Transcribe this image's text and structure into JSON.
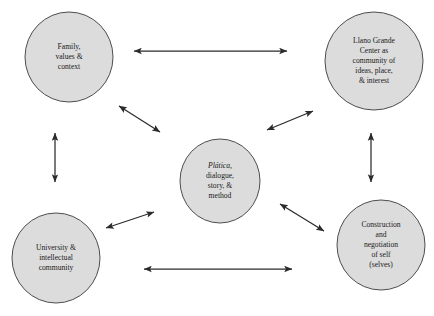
{
  "diagram": {
    "background_color": "#ffffff",
    "node_fill_color": "#dcdcdc",
    "node_stroke_color": "#4d4d4d",
    "connector_color": "#2b2b2b",
    "nodes": [
      {
        "id": "family",
        "name": "family-values-context",
        "cx": 69,
        "cy": 57,
        "rx": 44,
        "ry": 45,
        "lines": [
          "Family,",
          "values &",
          "context"
        ],
        "italic_first_line": false
      },
      {
        "id": "llano",
        "name": "llano-grande-center",
        "cx": 374,
        "cy": 61,
        "rx": 49,
        "ry": 49,
        "lines": [
          "Llano Grande",
          "Center as",
          "community of",
          "ideas, place,",
          "& interest"
        ],
        "italic_first_line": false
      },
      {
        "id": "platica",
        "name": "platica-dialogue-story-method",
        "cx": 220,
        "cy": 181,
        "rx": 40,
        "ry": 42,
        "lines": [
          "Plática,",
          "dialogue,",
          "story, &",
          "method"
        ],
        "italic_first_line": true
      },
      {
        "id": "university",
        "name": "university-intellectual-community",
        "cx": 56,
        "cy": 258,
        "rx": 44,
        "ry": 45,
        "lines": [
          "University &",
          "intellectual",
          "community"
        ],
        "italic_first_line": false
      },
      {
        "id": "construction",
        "name": "construction-negotiation-of-self",
        "cx": 381,
        "cy": 245,
        "rx": 44,
        "ry": 45,
        "lines": [
          "Construction",
          "and",
          "negotiation",
          "of self",
          "(selves)"
        ],
        "italic_first_line": false
      }
    ],
    "connectors": [
      {
        "id": "family-llano",
        "name": "connector-family-to-llano",
        "x1": 134,
        "y1": 51,
        "x2": 287,
        "y2": 51,
        "double_headed": true
      },
      {
        "id": "family-university",
        "name": "connector-family-to-university",
        "x1": 55,
        "y1": 133,
        "x2": 55,
        "y2": 182,
        "double_headed": true
      },
      {
        "id": "llano-construction",
        "name": "connector-llano-to-construction",
        "x1": 371,
        "y1": 133,
        "x2": 371,
        "y2": 182,
        "double_headed": true
      },
      {
        "id": "university-construction",
        "name": "connector-university-to-construction",
        "x1": 144,
        "y1": 269,
        "x2": 292,
        "y2": 269,
        "double_headed": true
      },
      {
        "id": "family-platica",
        "name": "connector-family-to-platica",
        "x1": 119,
        "y1": 106,
        "x2": 160,
        "y2": 132,
        "double_headed": true
      },
      {
        "id": "llano-platica",
        "name": "connector-llano-to-platica",
        "x1": 313,
        "y1": 111,
        "x2": 267,
        "y2": 130,
        "double_headed": true
      },
      {
        "id": "university-platica",
        "name": "connector-university-to-platica",
        "x1": 106,
        "y1": 228,
        "x2": 154,
        "y2": 212,
        "double_headed": true
      },
      {
        "id": "construction-platica",
        "name": "connector-construction-to-platica",
        "x1": 280,
        "y1": 204,
        "x2": 324,
        "y2": 231,
        "double_headed": true
      }
    ]
  }
}
